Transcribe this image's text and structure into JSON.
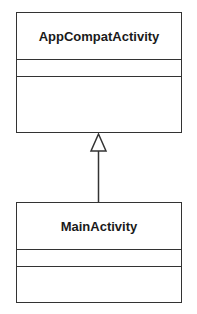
{
  "diagram": {
    "type": "uml-class-diagram",
    "classes": [
      {
        "id": "superclass",
        "name": "AppCompatActivity",
        "attributes": [],
        "operations": []
      },
      {
        "id": "subclass",
        "name": "MainActivity",
        "attributes": [],
        "operations": []
      }
    ],
    "relationships": [
      {
        "type": "generalization",
        "from": "MainActivity",
        "to": "AppCompatActivity"
      }
    ],
    "colors": {
      "line": "#333333",
      "text": "#1a1a1a",
      "background": "#ffffff"
    }
  }
}
